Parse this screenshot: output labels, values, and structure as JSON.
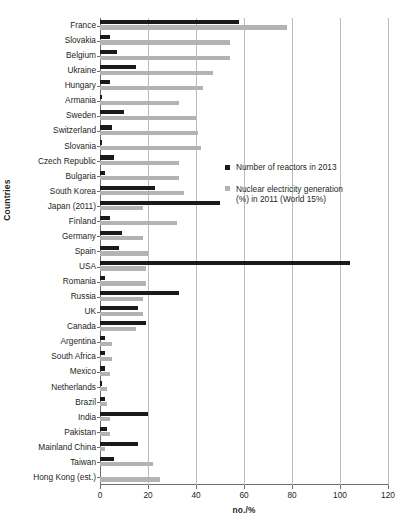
{
  "chart_data": {
    "type": "bar",
    "orientation": "horizontal",
    "title": "",
    "xlabel": "no./%",
    "ylabel": "Countries",
    "xlim": [
      0,
      120
    ],
    "xticks": [
      0,
      20,
      40,
      60,
      80,
      100,
      120
    ],
    "grid": "vertical",
    "legend_position": "inside-right",
    "categories": [
      "France",
      "Slovakia",
      "Belgium",
      "Ukraine",
      "Hungary",
      "Armania",
      "Sweden",
      "Switzerland",
      "Slovania",
      "Czech Republic",
      "Bulgaria",
      "South Korea",
      "Japan (2011)",
      "Finland",
      "Germany",
      "Spain",
      "USA",
      "Romania",
      "Russia",
      "UK",
      "Canada",
      "Argentina",
      "South Africa",
      "Mexico",
      "Netherlands",
      "Brazil",
      "India",
      "Pakistan",
      "Mainland China",
      "Taiwan",
      "Hong Kong (est.)"
    ],
    "series": [
      {
        "name": "Number of reactors in 2013",
        "color": "#1a1a1a",
        "values": [
          58,
          4,
          7,
          15,
          4,
          1,
          10,
          5,
          1,
          6,
          2,
          23,
          50,
          4,
          9,
          8,
          104,
          2,
          33,
          16,
          19,
          2,
          2,
          2,
          1,
          2,
          20,
          3,
          16,
          6,
          0
        ]
      },
      {
        "name": "Nuclear electricity generation (%) in 2011 (World 15%)",
        "color": "#b3b3b3",
        "values": [
          78,
          54,
          54,
          47,
          43,
          33,
          40,
          41,
          42,
          33,
          33,
          35,
          18,
          32,
          18,
          20,
          19,
          19,
          18,
          18,
          15,
          5,
          5,
          4,
          3,
          3,
          4,
          4,
          2,
          22,
          25
        ]
      }
    ]
  },
  "legend": {
    "entries": [
      {
        "label": "Number of reactors in 2013",
        "label_line2": ""
      },
      {
        "label": "Nuclear electricity generation",
        "label_line2": "(%) in 2011 (World 15%)"
      }
    ]
  }
}
